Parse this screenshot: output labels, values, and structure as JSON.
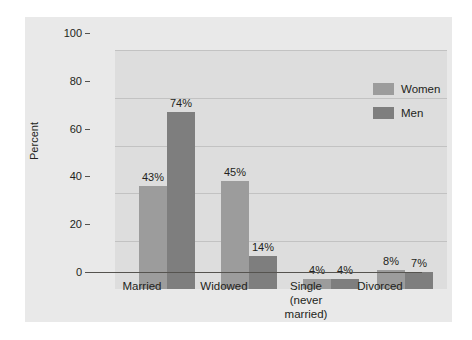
{
  "chart_data": {
    "type": "bar",
    "title": "",
    "xlabel": "",
    "ylabel": "Percent",
    "ylim": [
      0,
      100
    ],
    "yticks": [
      0,
      20,
      40,
      60,
      80,
      100
    ],
    "ytick_labels": [
      "0",
      "20",
      "40",
      "60",
      "80",
      "100"
    ],
    "grid": true,
    "legend_position": "upper right",
    "categories": [
      "Married",
      "Widowed",
      "Single\n(never\nmarried)",
      "Divorced"
    ],
    "series": [
      {
        "name": "Women",
        "color": "#9c9c9c",
        "values": [
          43,
          45,
          4,
          8
        ],
        "value_labels": [
          "43%",
          "45%",
          "4%",
          "8%"
        ]
      },
      {
        "name": "Men",
        "color": "#7e7e7e",
        "values": [
          74,
          14,
          4,
          7
        ],
        "value_labels": [
          "74%",
          "14%",
          "4%",
          "7%"
        ]
      }
    ]
  },
  "legend": {
    "items": [
      {
        "label": "Women",
        "color": "#9c9c9c"
      },
      {
        "label": "Men",
        "color": "#7e7e7e"
      }
    ]
  },
  "axes": {
    "y_title": "Percent"
  },
  "colors": {
    "page_background": "#ffffff",
    "frame_background": "#e9e9e9",
    "plot_background": "#dddddd",
    "gridline": "#c2c2c2",
    "axis_line": "#55534f",
    "text": "#231f20"
  }
}
